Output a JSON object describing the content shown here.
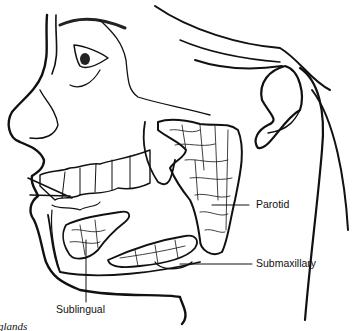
{
  "diagram": {
    "labels": {
      "parotid": "Parotid",
      "submaxillary": "Submaxillary",
      "sublingual": "Sublingual"
    },
    "caption_fragment": "glands",
    "colors": {
      "line": "#111111",
      "background": "#ffffff"
    }
  }
}
